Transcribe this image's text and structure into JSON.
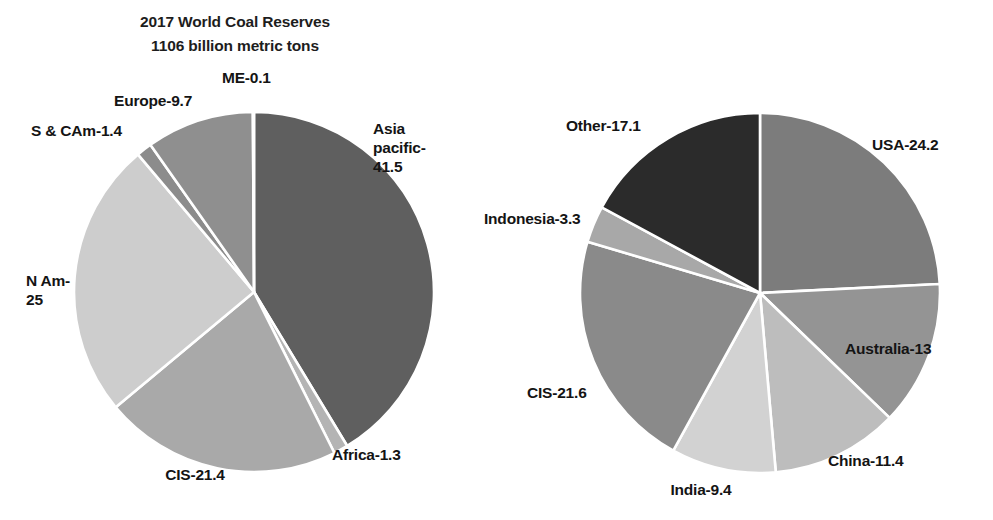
{
  "chart_data": [
    {
      "type": "pie",
      "id": "world-coal-reserves-by-region",
      "title": "2017 World Coal Reserves\n1106 billion metric tons",
      "title_line1": "2017 World Coal Reserves",
      "title_line2": "1106 billion metric tons",
      "unit": "percent",
      "legend": "none",
      "labels_inline": true,
      "start_angle_deg": 0,
      "direction": "clockwise",
      "categories": [
        "Asia pacific",
        "Africa",
        "CIS",
        "N Am",
        "S & CAm",
        "Europe",
        "ME"
      ],
      "values": [
        41.5,
        1.3,
        21.4,
        25,
        1.4,
        9.7,
        0.1
      ],
      "slices": [
        {
          "name": "Asia pacific",
          "value": 41.5,
          "label": "Asia\npacific-\n41.5",
          "color": "#5f5f5f"
        },
        {
          "name": "Africa",
          "value": 1.3,
          "label": "Africa-1.3",
          "color": "#b4b4b4"
        },
        {
          "name": "CIS",
          "value": 21.4,
          "label": "CIS-21.4",
          "color": "#a9a9a9"
        },
        {
          "name": "N Am",
          "value": 25,
          "label": "N Am-\n25",
          "color": "#cdcdcd"
        },
        {
          "name": "S & CAm",
          "value": 1.4,
          "label": "S & CAm-1.4",
          "color": "#8c8c8c"
        },
        {
          "name": "Europe",
          "value": 9.7,
          "label": "Europe-9.7",
          "color": "#8f8f8f"
        },
        {
          "name": "ME",
          "value": 0.1,
          "label": "ME-0.1",
          "color": "#8f8f8f"
        }
      ]
    },
    {
      "type": "pie",
      "id": "world-coal-reserves-by-country",
      "title": "2017 World Coal Reserves\n1106 billion metric tons",
      "title_line1": "2017 World Coal Reserves",
      "title_line2": "1106 billion metric tons",
      "unit": "percent",
      "legend": "none",
      "labels_inline": true,
      "start_angle_deg": 0,
      "direction": "clockwise",
      "categories": [
        "USA",
        "Australia",
        "China",
        "India",
        "CIS",
        "Indonesia",
        "Other"
      ],
      "values": [
        24.2,
        13,
        11.4,
        9.4,
        21.6,
        3.3,
        17.1
      ],
      "slices": [
        {
          "name": "USA",
          "value": 24.2,
          "label": "USA-24.2",
          "color": "#7c7c7c"
        },
        {
          "name": "Australia",
          "value": 13,
          "label": "Australia-13",
          "color": "#949494"
        },
        {
          "name": "China",
          "value": 11.4,
          "label": "China-11.4",
          "color": "#bdbdbd"
        },
        {
          "name": "India",
          "value": 9.4,
          "label": "India-9.4",
          "color": "#d2d2d2"
        },
        {
          "name": "CIS",
          "value": 21.6,
          "label": "CIS-21.6",
          "color": "#8a8a8a"
        },
        {
          "name": "Indonesia",
          "value": 3.3,
          "label": "Indonesia-3.3",
          "color": "#a8a8a8"
        },
        {
          "name": "Other",
          "value": 17.1,
          "label": "Other-17.1",
          "color": "#2b2b2b"
        }
      ]
    }
  ],
  "colors": {
    "background": "#ffffff",
    "text": "#141414",
    "slice_divider": "#ffffff"
  }
}
